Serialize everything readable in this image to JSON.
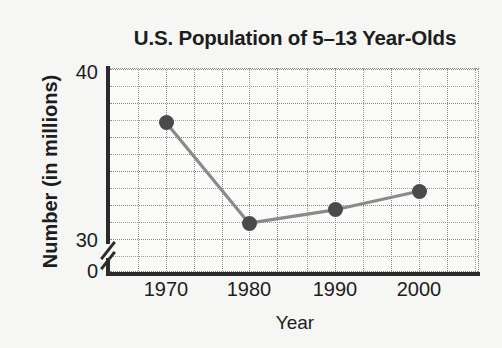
{
  "chart_data": {
    "type": "line",
    "title": "U.S. Population of 5–13 Year-Olds",
    "xlabel": "Year",
    "ylabel": "Number (in millions)",
    "categories": [
      "1970",
      "1980",
      "1990",
      "2000"
    ],
    "x": [
      1970,
      1980,
      1990,
      2000
    ],
    "values": [
      37.0,
      31.0,
      31.8,
      32.9
    ],
    "series": [
      {
        "name": "U.S. Population of 5-13 Year-Olds",
        "values": [
          37.0,
          31.0,
          31.8,
          32.9
        ]
      }
    ],
    "xtick_labels": [
      "1970",
      "1980",
      "1990",
      "2000"
    ],
    "ytick_labels": [
      "40",
      "30",
      "0"
    ],
    "ylim": [
      30,
      40
    ],
    "xlim": [
      1965,
      2005
    ],
    "grid": true,
    "axis_break": true,
    "axis_break_between": [
      0,
      30
    ],
    "legend": "none",
    "line_color": "#8a8a8a",
    "marker_color": "#4a4a4a",
    "axis_color": "#2b2b2b",
    "grid_color": "#9a9a9a",
    "background_color": "#f6f6f4",
    "plot_background_color": "#fbfbfa"
  },
  "icons": {
    "axis_break": "axis-break-slash"
  }
}
